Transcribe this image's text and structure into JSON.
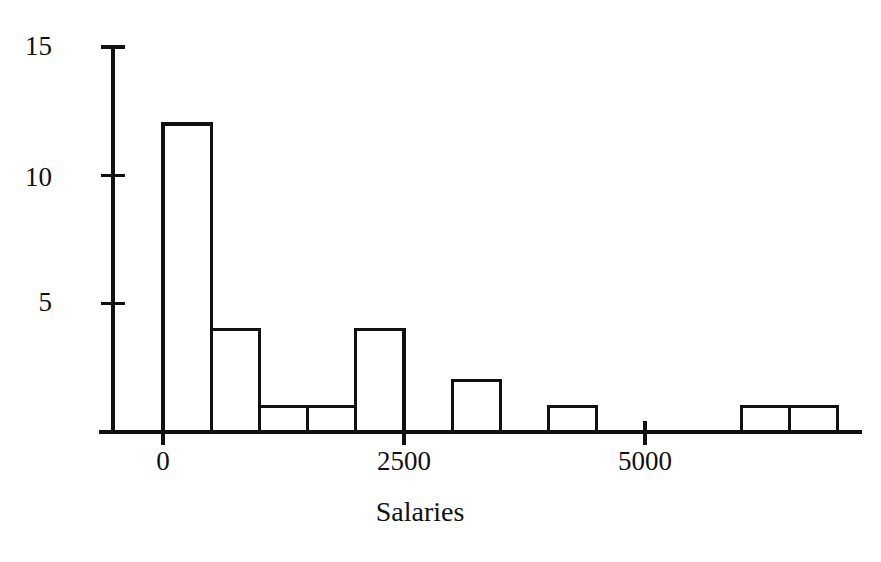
{
  "chart_data": {
    "type": "bar",
    "title": "",
    "subtitle": "",
    "xlabel": "Salaries",
    "ylabel": "",
    "grid": false,
    "legend": false,
    "bin_width": 500,
    "bin_starts": [
      0,
      500,
      1000,
      1500,
      2000,
      2500,
      3000,
      3500,
      4000,
      4500,
      5000,
      5500,
      6000,
      6500
    ],
    "categories": [
      "0-500",
      "500-1000",
      "1000-1500",
      "1500-2000",
      "2000-2500",
      "2500-3000",
      "3000-3500",
      "3500-4000",
      "4000-4500",
      "4500-5000",
      "5000-5500",
      "5500-6000",
      "6000-6500",
      "6500-7000"
    ],
    "values": [
      12,
      4,
      1,
      1,
      4,
      0,
      2,
      0,
      1,
      0,
      0,
      0,
      1,
      1
    ],
    "xlim": [
      -250,
      7250
    ],
    "ylim": [
      0,
      15
    ],
    "xticks": [
      0,
      2500,
      5000
    ],
    "xtick_labels": [
      "0",
      "2500",
      "5000"
    ],
    "yticks": [
      5,
      10,
      15
    ],
    "ytick_labels": [
      "5",
      "10",
      "15"
    ],
    "colors": {
      "bar_fill": "#ffffff",
      "bar_edge": "#111111",
      "axis": "#111111",
      "background": "#ffffff",
      "text": "#111111"
    }
  },
  "axis_titles": {
    "x": "Salaries"
  }
}
